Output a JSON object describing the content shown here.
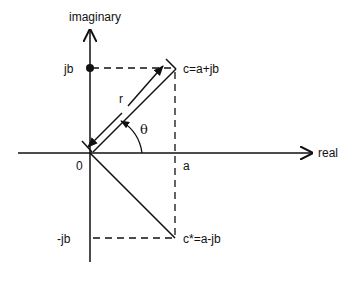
{
  "diagram": {
    "axes": {
      "horizontal_label": "real",
      "vertical_label": "imaginary",
      "origin_label": "0"
    },
    "labels": {
      "a": "a",
      "jb": "jb",
      "neg_jb": "-jb",
      "c": "c=a+jb",
      "c_conj": "c*=a-jb",
      "r": "r",
      "theta": "θ"
    },
    "colors": {
      "stroke": "#111111",
      "background": "#ffffff"
    }
  }
}
